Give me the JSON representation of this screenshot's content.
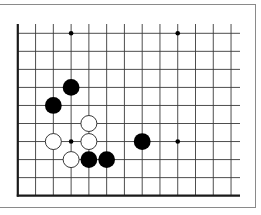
{
  "diagram": {
    "type": "go-board-fragment",
    "columns": 13,
    "rows": 10,
    "open_edges": [
      "top",
      "right"
    ],
    "board_edges": [
      "left",
      "bottom"
    ],
    "colors": {
      "background": "#ffffff",
      "grid_line": "#3a3a3a",
      "edge_line": "#1a1a1a",
      "frame": "#8a8a8a",
      "black_stone": "#000000",
      "white_stone_fill": "#ffffff",
      "white_stone_stroke": "#222222"
    },
    "hoshi": [
      {
        "col": 3,
        "row": 0
      },
      {
        "col": 9,
        "row": 0
      },
      {
        "col": 3,
        "row": 6
      },
      {
        "col": 9,
        "row": 6
      }
    ],
    "stones": [
      {
        "color": "black",
        "col": 3,
        "row": 3
      },
      {
        "color": "black",
        "col": 2,
        "row": 4
      },
      {
        "color": "white",
        "col": 4,
        "row": 5
      },
      {
        "color": "white",
        "col": 2,
        "row": 6
      },
      {
        "color": "white",
        "col": 4,
        "row": 6
      },
      {
        "color": "black",
        "col": 7,
        "row": 6
      },
      {
        "color": "white",
        "col": 3,
        "row": 7
      },
      {
        "color": "black",
        "col": 4,
        "row": 7
      },
      {
        "color": "black",
        "col": 5,
        "row": 7
      }
    ]
  }
}
